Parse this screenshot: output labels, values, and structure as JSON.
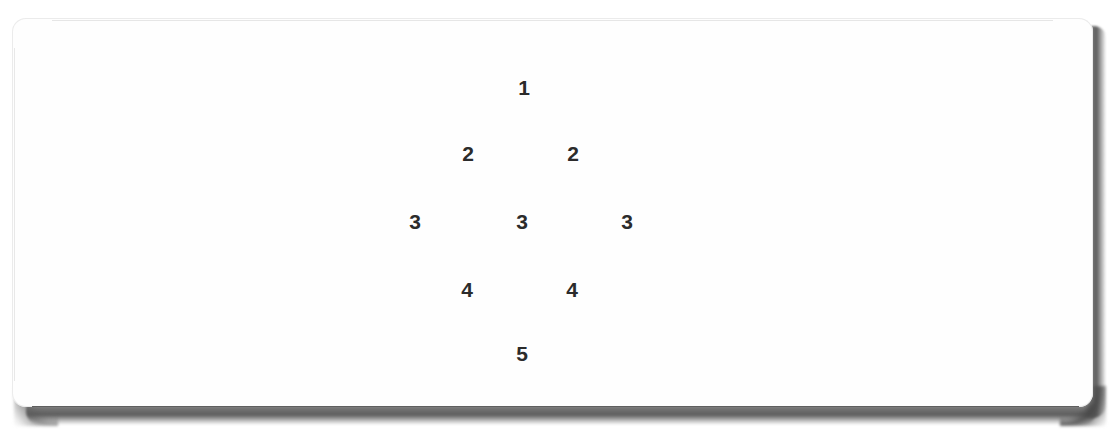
{
  "canvas": {
    "width": 1119,
    "height": 442,
    "background_color": "#ffffff"
  },
  "page_card": {
    "name": "scanned-page",
    "background_color": "#fefefe",
    "edge_line_color": "#282828",
    "shadow_color": "#505050",
    "corner_radius_px": 14
  },
  "diagram": {
    "title": "",
    "text_color": "#2b2b2b",
    "font_size_px": 21,
    "nodes": [
      {
        "label": "1",
        "x": 524,
        "y": 87
      },
      {
        "label": "2",
        "x": 468,
        "y": 153
      },
      {
        "label": "2",
        "x": 573,
        "y": 153
      },
      {
        "label": "3",
        "x": 415,
        "y": 221
      },
      {
        "label": "3",
        "x": 522,
        "y": 221
      },
      {
        "label": "3",
        "x": 627,
        "y": 221
      },
      {
        "label": "4",
        "x": 467,
        "y": 289
      },
      {
        "label": "4",
        "x": 572,
        "y": 289
      },
      {
        "label": "5",
        "x": 522,
        "y": 353
      }
    ],
    "rows": [
      {
        "level": 1,
        "values": [
          "1"
        ]
      },
      {
        "level": 2,
        "values": [
          "2",
          "2"
        ]
      },
      {
        "level": 3,
        "values": [
          "3",
          "3",
          "3"
        ]
      },
      {
        "level": 4,
        "values": [
          "4",
          "4"
        ]
      },
      {
        "level": 5,
        "values": [
          "5"
        ]
      }
    ]
  }
}
